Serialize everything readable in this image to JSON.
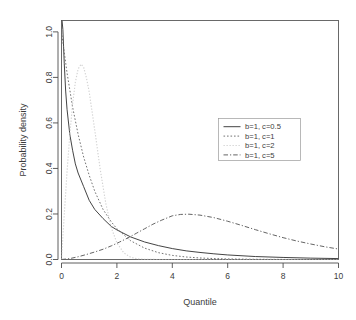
{
  "chart_data": {
    "type": "line",
    "title": "",
    "xlabel": "Quantile",
    "ylabel": "Probability density",
    "xlim": [
      0,
      10
    ],
    "ylim": [
      0,
      1.05
    ],
    "xticks": [
      "0",
      "2",
      "4",
      "6",
      "8",
      "10"
    ],
    "xtick_values": [
      0,
      2,
      4,
      6,
      8,
      10
    ],
    "yticks": [
      "0.0",
      "0.2",
      "0.4",
      "0.6",
      "0.8",
      "1.0"
    ],
    "ytick_values": [
      0.0,
      0.2,
      0.4,
      0.6,
      0.8,
      1.0
    ],
    "grid": false,
    "legend_position": "center-right",
    "series": [
      {
        "name": "b=1, c=0.5",
        "style": "solid",
        "color": "#3a3a3a",
        "x": [
          0.02,
          0.05,
          0.1,
          0.15,
          0.2,
          0.3,
          0.4,
          0.5,
          0.6,
          0.8,
          1.0,
          1.2,
          1.5,
          1.8,
          2.0,
          2.5,
          3.0,
          3.5,
          4.0,
          4.5,
          5.0,
          5.5,
          6.0,
          7.0,
          8.0,
          9.0,
          10.0
        ],
        "y": [
          1.05,
          1.01,
          0.86,
          0.74,
          0.66,
          0.55,
          0.48,
          0.42,
          0.38,
          0.32,
          0.26,
          0.22,
          0.18,
          0.145,
          0.13,
          0.099,
          0.077,
          0.061,
          0.048,
          0.038,
          0.031,
          0.025,
          0.02,
          0.013,
          0.009,
          0.006,
          0.004
        ]
      },
      {
        "name": "b=1, c=1",
        "style": "dotted",
        "color": "#6b6b6b",
        "x": [
          0.0,
          0.2,
          0.4,
          0.6,
          0.8,
          1.0,
          1.2,
          1.5,
          1.8,
          2.0,
          2.5,
          3.0,
          3.5,
          4.0,
          4.5,
          5.0,
          5.5,
          6.0,
          7.0,
          8.0,
          9.0,
          10.0
        ],
        "y": [
          1.0,
          0.82,
          0.67,
          0.55,
          0.45,
          0.37,
          0.3,
          0.22,
          0.165,
          0.135,
          0.082,
          0.05,
          0.03,
          0.018,
          0.011,
          0.0067,
          0.0041,
          0.0025,
          0.0009,
          0.0003,
          0.0001,
          5e-05
        ]
      },
      {
        "name": "b=1, c=2",
        "style": "lightdotted",
        "color": "#d2d2d2",
        "x": [
          0.0,
          0.1,
          0.2,
          0.3,
          0.4,
          0.5,
          0.6,
          0.707,
          0.8,
          0.9,
          1.0,
          1.2,
          1.4,
          1.6,
          1.8,
          2.0,
          2.25,
          2.5,
          2.75,
          3.0,
          3.5,
          4.0,
          4.5,
          5.0,
          6.0,
          7.0,
          8.0,
          10.0
        ],
        "y": [
          0.0,
          0.198,
          0.384,
          0.549,
          0.682,
          0.779,
          0.837,
          0.858,
          0.844,
          0.798,
          0.736,
          0.569,
          0.394,
          0.246,
          0.139,
          0.073,
          0.029,
          0.0097,
          0.0029,
          0.00074,
          3e-05,
          2e-07,
          0.0,
          0.0,
          0.0,
          0.0,
          0.0,
          0.0
        ]
      },
      {
        "name": "b=1, c=5",
        "style": "dashdot",
        "color": "#5c5c5c",
        "x": [
          0.0,
          0.3,
          0.6,
          0.9,
          1.2,
          1.5,
          1.8,
          2.1,
          2.4,
          2.7,
          3.0,
          3.3,
          3.6,
          4.0,
          4.3,
          4.6,
          5.0,
          5.5,
          6.0,
          6.5,
          7.0,
          7.5,
          8.0,
          8.5,
          9.0,
          9.5,
          10.0
        ],
        "y": [
          0.0,
          0.004,
          0.012,
          0.022,
          0.033,
          0.045,
          0.06,
          0.077,
          0.095,
          0.115,
          0.135,
          0.155,
          0.172,
          0.192,
          0.198,
          0.199,
          0.195,
          0.184,
          0.168,
          0.15,
          0.131,
          0.113,
          0.096,
          0.081,
          0.068,
          0.056,
          0.046
        ]
      }
    ]
  },
  "axis": {
    "x_title": "Quantile",
    "y_title": "Probability density"
  }
}
